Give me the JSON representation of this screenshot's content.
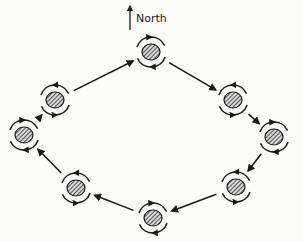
{
  "diagram": {
    "north_label": "North",
    "north_arrow": {
      "x": 130,
      "y1": 30,
      "y2": 4
    },
    "colors": {
      "ink": "#1a1a1a",
      "background": "#fbfbfa",
      "hatch_bg": "#d9d9d9"
    },
    "nodes": [
      {
        "id": "top",
        "x": 151,
        "y": 52,
        "rotation": "clockwise"
      },
      {
        "id": "upper-right",
        "x": 233,
        "y": 100,
        "rotation": "counterclockwise"
      },
      {
        "id": "right",
        "x": 274,
        "y": 137,
        "rotation": "clockwise"
      },
      {
        "id": "lower-right",
        "x": 236,
        "y": 187,
        "rotation": "counterclockwise"
      },
      {
        "id": "bottom",
        "x": 153,
        "y": 218,
        "rotation": "clockwise"
      },
      {
        "id": "lower-left",
        "x": 76,
        "y": 188,
        "rotation": "counterclockwise"
      },
      {
        "id": "left",
        "x": 24,
        "y": 135,
        "rotation": "clockwise"
      },
      {
        "id": "upper-left",
        "x": 55,
        "y": 100,
        "rotation": "counterclockwise"
      }
    ],
    "flow_direction": "clockwise around ring",
    "flow_arrows": [
      {
        "from": "upper-left",
        "to": "top"
      },
      {
        "from": "top",
        "to": "upper-right"
      },
      {
        "from": "upper-right",
        "to": "right"
      },
      {
        "from": "right",
        "to": "lower-right"
      },
      {
        "from": "lower-right",
        "to": "bottom"
      },
      {
        "from": "bottom",
        "to": "lower-left"
      },
      {
        "from": "lower-left",
        "to": "left"
      },
      {
        "from": "left",
        "to": "upper-left"
      }
    ]
  }
}
